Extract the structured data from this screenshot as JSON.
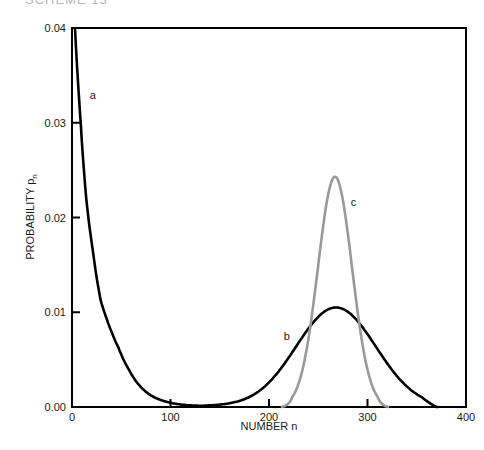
{
  "header": {
    "cutoff_title": "SCHEME 13"
  },
  "chart_data": {
    "type": "line",
    "title": "",
    "xlabel": "NUMBER n",
    "ylabel": "PROBABILITY p",
    "ylabel_subscript": "n",
    "xlim": [
      0,
      400
    ],
    "ylim": [
      0,
      0.04
    ],
    "x_ticks": [
      0,
      100,
      200,
      300,
      400
    ],
    "x_tick_labels": [
      "0",
      "100",
      "200",
      "300",
      "400"
    ],
    "y_ticks": [
      0.0,
      0.01,
      0.02,
      0.03,
      0.04
    ],
    "y_tick_labels": [
      "0.00",
      "0.01",
      "0.02",
      "0.03",
      "0.04"
    ],
    "grid": false,
    "legend": "none (curves labeled inline a, b, c)",
    "series": [
      {
        "name": "a",
        "color": "#000000",
        "label_pos": {
          "x": 18,
          "y": 0.0325
        },
        "x": [
          3,
          9,
          14.5,
          21,
          29,
          38,
          47,
          58,
          70,
          84,
          98,
          115,
          131,
          150,
          165
        ],
        "values": [
          0.04,
          0.0297,
          0.0219,
          0.0166,
          0.0113,
          0.0085,
          0.0063,
          0.0039,
          0.0021,
          0.001,
          0.0005,
          0.0002,
          0.0001,
          0.0001,
          0.0001
        ]
      },
      {
        "name": "b",
        "color": "#000000",
        "label_pos": {
          "x": 215,
          "y": 0.0071
        },
        "x": [
          130,
          150,
          175,
          200,
          221,
          245,
          268,
          290,
          311,
          335,
          355,
          370
        ],
        "values": [
          0.0001,
          0.0002,
          0.0007,
          0.0025,
          0.0057,
          0.0089,
          0.0105,
          0.009,
          0.0057,
          0.0025,
          0.0008,
          0.0
        ]
      },
      {
        "name": "c",
        "color": "#999999",
        "label_pos": {
          "x": 283,
          "y": 0.0212
        },
        "x": [
          212,
          225,
          235,
          245,
          255,
          267,
          279,
          290,
          300,
          310,
          322
        ],
        "values": [
          0.0,
          0.0012,
          0.0052,
          0.0105,
          0.019,
          0.0243,
          0.019,
          0.0105,
          0.0052,
          0.0012,
          0.0
        ]
      }
    ],
    "model": {
      "a": {
        "form": "exponential decay",
        "start": 0.04
      },
      "b": {
        "form": "gaussian",
        "mean": 268,
        "sigma": 40.5,
        "peak": 0.0105
      },
      "c": {
        "form": "gaussian",
        "mean": 267,
        "sigma": 17.3,
        "peak": 0.0243
      }
    }
  }
}
